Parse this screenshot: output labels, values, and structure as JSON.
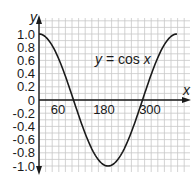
{
  "chart_data": {
    "type": "line",
    "title": "",
    "annotation": "y = cos x",
    "annotation_parts": {
      "y": "y",
      "eq": " = cos ",
      "x": "x"
    },
    "xlabel": "x",
    "ylabel": "y",
    "xlim": [
      0,
      390
    ],
    "ylim": [
      -1.0,
      1.0
    ],
    "x_ticks": [
      60,
      180,
      300
    ],
    "x_tick_labels": [
      "60",
      "180",
      "300"
    ],
    "y_ticks": [
      1.0,
      0.8,
      0.6,
      0.4,
      0.2,
      0,
      -0.2,
      -0.4,
      -0.6,
      -0.8,
      -1.0
    ],
    "y_tick_labels": [
      "1.0",
      "0.8",
      "0.6",
      "0.4",
      "0.2",
      "0",
      "-0.2",
      "-0.4",
      "-0.6",
      "-0.8",
      "-1.0"
    ],
    "grid": true,
    "legend": "none",
    "series": [
      {
        "name": "y = cos x",
        "x": [
          0,
          30,
          60,
          90,
          120,
          150,
          180,
          210,
          240,
          270,
          300,
          330,
          360
        ],
        "values": [
          1.0,
          0.87,
          0.5,
          0.0,
          -0.5,
          -0.87,
          -1.0,
          -0.87,
          -0.5,
          0.0,
          0.5,
          0.87,
          1.0
        ]
      }
    ]
  },
  "colors": {
    "curve": "#1a1a1a",
    "axis": "#1a1a1a",
    "grid": "#c8c8c8",
    "background": "#ffffff"
  }
}
